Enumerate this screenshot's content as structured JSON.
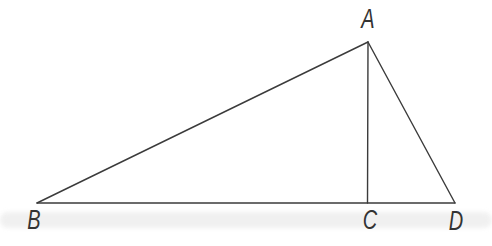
{
  "figure": {
    "background_color": "#ffffff",
    "stroke_color": "#3b3b3b",
    "stroke_width": 1.4,
    "label_color": "#333333",
    "points": {
      "A": {
        "x": 368,
        "y": 42
      },
      "B": {
        "x": 37,
        "y": 203
      },
      "C": {
        "x": 367.5,
        "y": 203
      },
      "D": {
        "x": 455,
        "y": 203
      }
    },
    "edges": [
      {
        "from": "B",
        "to": "A"
      },
      {
        "from": "A",
        "to": "C"
      },
      {
        "from": "A",
        "to": "D"
      },
      {
        "from": "B",
        "to": "D"
      }
    ],
    "labels": [
      {
        "text": "A",
        "x": 368,
        "y": 19
      },
      {
        "text": "B",
        "x": 34,
        "y": 220
      },
      {
        "text": "C",
        "x": 370,
        "y": 220
      },
      {
        "text": "D",
        "x": 456,
        "y": 221
      }
    ],
    "scan_artifact_band": {
      "y": 212,
      "height": 16,
      "color": "#e9e9e9",
      "opacity": 0.65
    }
  }
}
